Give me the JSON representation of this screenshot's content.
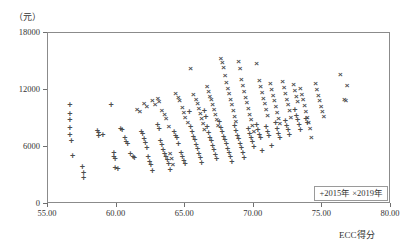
{
  "axes": {
    "y_unit_label": "（元）",
    "x_axis_title": "ECC得分",
    "y_ticks": [
      "18000",
      "12000",
      "6000",
      "0"
    ],
    "x_ticks": [
      "55.00",
      "60.00",
      "65.00",
      "70.00",
      "75.00",
      "80.00"
    ]
  },
  "legend": {
    "items": [
      {
        "symbol": "+",
        "label": "2015年"
      },
      {
        "symbol": "×",
        "label": "2019年"
      }
    ]
  },
  "colors": {
    "marker": "#4d4d4d",
    "frame": "#8b8b8b",
    "text": "#333333"
  },
  "chart_data": {
    "type": "scatter",
    "title": "",
    "xlabel": "ECC得分",
    "ylabel": "（元）",
    "xlim": [
      55.0,
      80.0
    ],
    "ylim": [
      0,
      18000
    ],
    "grid": false,
    "legend_position": "bottom-right",
    "xticks": [
      55.0,
      60.0,
      65.0,
      70.0,
      75.0,
      80.0
    ],
    "yticks": [
      0,
      6000,
      12000,
      18000
    ],
    "series": [
      {
        "name": "2015年",
        "marker": "+",
        "points": [
          [
            56.6,
            10400
          ],
          [
            56.6,
            9500
          ],
          [
            56.6,
            8800
          ],
          [
            56.6,
            8000
          ],
          [
            56.6,
            7300
          ],
          [
            56.7,
            6600
          ],
          [
            56.8,
            5100
          ],
          [
            57.5,
            3900
          ],
          [
            57.6,
            3300
          ],
          [
            57.6,
            2700
          ],
          [
            58.6,
            7700
          ],
          [
            58.7,
            7500
          ],
          [
            58.7,
            7200
          ],
          [
            59.0,
            7300
          ],
          [
            59.6,
            10400
          ],
          [
            59.8,
            5400
          ],
          [
            59.8,
            5000
          ],
          [
            59.9,
            4700
          ],
          [
            59.9,
            3800
          ],
          [
            60.1,
            3700
          ],
          [
            60.3,
            7900
          ],
          [
            60.4,
            7800
          ],
          [
            60.6,
            6900
          ],
          [
            60.7,
            6500
          ],
          [
            60.8,
            6300
          ],
          [
            61.0,
            5300
          ],
          [
            61.2,
            4900
          ],
          [
            61.3,
            4800
          ],
          [
            61.8,
            7600
          ],
          [
            61.9,
            7400
          ],
          [
            62.0,
            6800
          ],
          [
            62.1,
            6400
          ],
          [
            62.2,
            5900
          ],
          [
            62.3,
            5000
          ],
          [
            62.4,
            4400
          ],
          [
            62.5,
            4100
          ],
          [
            62.6,
            3500
          ],
          [
            63.0,
            8300
          ],
          [
            63.1,
            7900
          ],
          [
            63.2,
            6600
          ],
          [
            63.3,
            6200
          ],
          [
            63.4,
            5700
          ],
          [
            63.5,
            5300
          ],
          [
            63.6,
            5000
          ],
          [
            63.7,
            4600
          ],
          [
            63.8,
            4200
          ],
          [
            63.9,
            3600
          ],
          [
            64.2,
            7600
          ],
          [
            64.3,
            7200
          ],
          [
            64.4,
            6900
          ],
          [
            64.5,
            6300
          ],
          [
            64.7,
            5400
          ],
          [
            64.8,
            4900
          ],
          [
            64.9,
            4500
          ],
          [
            65.0,
            4200
          ],
          [
            65.3,
            9700
          ],
          [
            65.4,
            8100
          ],
          [
            65.5,
            7600
          ],
          [
            65.6,
            7100
          ],
          [
            65.7,
            6700
          ],
          [
            65.8,
            6200
          ],
          [
            65.9,
            5800
          ],
          [
            66.0,
            5300
          ],
          [
            66.1,
            4800
          ],
          [
            66.2,
            4300
          ],
          [
            66.4,
            9800
          ],
          [
            66.5,
            9200
          ],
          [
            66.6,
            8100
          ],
          [
            66.7,
            7500
          ],
          [
            66.8,
            7000
          ],
          [
            66.9,
            6600
          ],
          [
            67.0,
            6100
          ],
          [
            67.1,
            5700
          ],
          [
            67.2,
            5200
          ],
          [
            67.3,
            4700
          ],
          [
            67.5,
            8600
          ],
          [
            67.6,
            8000
          ],
          [
            67.7,
            7600
          ],
          [
            67.8,
            7100
          ],
          [
            67.9,
            6700
          ],
          [
            68.0,
            6300
          ],
          [
            68.1,
            5800
          ],
          [
            68.2,
            5400
          ],
          [
            68.3,
            4900
          ],
          [
            68.4,
            4400
          ],
          [
            68.6,
            8200
          ],
          [
            68.7,
            7700
          ],
          [
            68.8,
            7200
          ],
          [
            68.9,
            6800
          ],
          [
            69.0,
            6300
          ],
          [
            69.1,
            5900
          ],
          [
            69.2,
            5400
          ],
          [
            69.3,
            4800
          ],
          [
            69.6,
            7900
          ],
          [
            69.7,
            7400
          ],
          [
            69.8,
            7000
          ],
          [
            69.9,
            6500
          ],
          [
            70.0,
            6000
          ],
          [
            70.2,
            8300
          ],
          [
            70.3,
            7800
          ],
          [
            70.4,
            7300
          ],
          [
            70.5,
            6900
          ],
          [
            70.6,
            5600
          ],
          [
            70.9,
            8100
          ],
          [
            71.0,
            7600
          ],
          [
            71.1,
            7200
          ],
          [
            71.3,
            6100
          ],
          [
            71.6,
            8500
          ],
          [
            71.7,
            7900
          ],
          [
            71.8,
            7400
          ],
          [
            71.9,
            6900
          ],
          [
            72.3,
            8700
          ],
          [
            72.4,
            8200
          ],
          [
            72.5,
            7800
          ],
          [
            72.6,
            7300
          ],
          [
            73.0,
            9900
          ],
          [
            73.1,
            9300
          ],
          [
            73.2,
            8800
          ],
          [
            73.3,
            8300
          ],
          [
            73.4,
            7800
          ],
          [
            73.8,
            9000
          ],
          [
            73.9,
            8500
          ]
        ]
      },
      {
        "name": "2019年",
        "marker": "×",
        "points": [
          [
            61.5,
            9900
          ],
          [
            61.7,
            9700
          ],
          [
            62.0,
            10500
          ],
          [
            62.2,
            10200
          ],
          [
            62.6,
            10800
          ],
          [
            62.8,
            10400
          ],
          [
            63.0,
            11100
          ],
          [
            63.1,
            10700
          ],
          [
            63.3,
            9800
          ],
          [
            63.5,
            9400
          ],
          [
            63.6,
            8900
          ],
          [
            63.8,
            8100
          ],
          [
            63.9,
            5300
          ],
          [
            64.0,
            4700
          ],
          [
            64.1,
            4100
          ],
          [
            64.3,
            11600
          ],
          [
            64.5,
            11200
          ],
          [
            64.6,
            10800
          ],
          [
            64.8,
            10100
          ],
          [
            64.9,
            9600
          ],
          [
            65.0,
            9100
          ],
          [
            65.2,
            8500
          ],
          [
            65.4,
            14200
          ],
          [
            65.6,
            11500
          ],
          [
            65.8,
            11000
          ],
          [
            65.9,
            10500
          ],
          [
            66.0,
            10000
          ],
          [
            66.1,
            9500
          ],
          [
            66.2,
            9000
          ],
          [
            66.3,
            8400
          ],
          [
            66.4,
            7800
          ],
          [
            66.6,
            12300
          ],
          [
            66.7,
            11800
          ],
          [
            66.8,
            11300
          ],
          [
            66.9,
            10900
          ],
          [
            67.0,
            10400
          ],
          [
            67.1,
            9900
          ],
          [
            67.2,
            9400
          ],
          [
            67.3,
            8800
          ],
          [
            67.4,
            8200
          ],
          [
            67.6,
            15300
          ],
          [
            67.7,
            14800
          ],
          [
            67.8,
            14300
          ],
          [
            67.9,
            13500
          ],
          [
            68.0,
            12700
          ],
          [
            68.1,
            12100
          ],
          [
            68.2,
            11600
          ],
          [
            68.3,
            11000
          ],
          [
            68.4,
            10400
          ],
          [
            68.5,
            9800
          ],
          [
            68.6,
            9200
          ],
          [
            68.7,
            8600
          ],
          [
            68.9,
            14900
          ],
          [
            69.0,
            14200
          ],
          [
            69.1,
            13100
          ],
          [
            69.2,
            12400
          ],
          [
            69.3,
            11800
          ],
          [
            69.4,
            11200
          ],
          [
            69.5,
            10600
          ],
          [
            69.6,
            10000
          ],
          [
            69.7,
            9400
          ],
          [
            69.8,
            8800
          ],
          [
            69.9,
            8200
          ],
          [
            70.0,
            7600
          ],
          [
            70.2,
            14700
          ],
          [
            70.4,
            12900
          ],
          [
            70.5,
            12300
          ],
          [
            70.6,
            11700
          ],
          [
            70.7,
            11100
          ],
          [
            70.8,
            10500
          ],
          [
            70.9,
            9900
          ],
          [
            71.0,
            9300
          ],
          [
            71.2,
            12600
          ],
          [
            71.3,
            12000
          ],
          [
            71.4,
            11400
          ],
          [
            71.5,
            10800
          ],
          [
            71.6,
            10200
          ],
          [
            71.7,
            9600
          ],
          [
            71.8,
            9000
          ],
          [
            71.9,
            8400
          ],
          [
            72.1,
            12800
          ],
          [
            72.2,
            12200
          ],
          [
            72.3,
            11600
          ],
          [
            72.4,
            11000
          ],
          [
            72.5,
            10400
          ],
          [
            72.6,
            9800
          ],
          [
            72.7,
            9100
          ],
          [
            72.9,
            12500
          ],
          [
            73.0,
            11900
          ],
          [
            73.1,
            11300
          ],
          [
            73.2,
            10700
          ],
          [
            73.4,
            12100
          ],
          [
            73.5,
            11500
          ],
          [
            73.6,
            10900
          ],
          [
            73.7,
            10300
          ],
          [
            73.8,
            9700
          ],
          [
            73.9,
            9100
          ],
          [
            74.0,
            8500
          ],
          [
            74.1,
            7900
          ],
          [
            74.2,
            6900
          ],
          [
            74.5,
            12600
          ],
          [
            74.6,
            12000
          ],
          [
            74.7,
            11400
          ],
          [
            74.8,
            10800
          ],
          [
            74.9,
            10200
          ],
          [
            75.0,
            9700
          ],
          [
            75.1,
            9200
          ],
          [
            76.3,
            13600
          ],
          [
            76.8,
            12400
          ],
          [
            76.6,
            10900
          ],
          [
            76.7,
            10800
          ]
        ]
      }
    ]
  }
}
